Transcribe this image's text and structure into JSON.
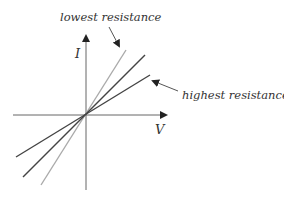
{
  "diagram": {
    "type": "IV characteristic lines through origin",
    "axes": {
      "x_label": "V",
      "y_label": "I"
    },
    "lines": [
      {
        "name": "lowest-resistance",
        "color": "#a8a8a8",
        "relative_slope": "steepest"
      },
      {
        "name": "middle-resistance",
        "color": "#4a4a4a",
        "relative_slope": "medium"
      },
      {
        "name": "highest-resistance",
        "color": "#4a4a4a",
        "relative_slope": "shallowest"
      }
    ],
    "annotations": {
      "lowest": "lowest resistance",
      "highest": "highest resistance"
    },
    "colors": {
      "axis": "#555555",
      "text": "#333333"
    }
  }
}
